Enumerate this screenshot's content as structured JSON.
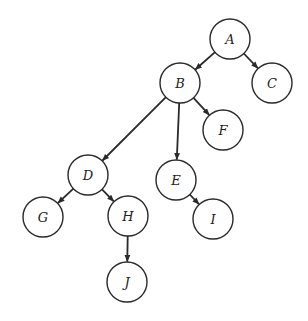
{
  "diagram": {
    "type": "tree",
    "directed": true,
    "node_radius": 20,
    "colors": {
      "background": "#ffffff",
      "stroke": "#2a2a2a",
      "label": "#222222"
    },
    "nodes": [
      {
        "id": "A",
        "label": "A",
        "x": 230,
        "y": 39
      },
      {
        "id": "B",
        "label": "B",
        "x": 180,
        "y": 83
      },
      {
        "id": "C",
        "label": "C",
        "x": 272,
        "y": 83
      },
      {
        "id": "D",
        "label": "D",
        "x": 88,
        "y": 175
      },
      {
        "id": "E",
        "label": "E",
        "x": 176,
        "y": 180
      },
      {
        "id": "F",
        "label": "F",
        "x": 223,
        "y": 130
      },
      {
        "id": "G",
        "label": "G",
        "x": 43,
        "y": 217
      },
      {
        "id": "H",
        "label": "H",
        "x": 128,
        "y": 216
      },
      {
        "id": "I",
        "label": "I",
        "x": 213,
        "y": 219
      },
      {
        "id": "J",
        "label": "J",
        "x": 127,
        "y": 282
      }
    ],
    "edges": [
      {
        "from": "A",
        "to": "B"
      },
      {
        "from": "A",
        "to": "C"
      },
      {
        "from": "B",
        "to": "D"
      },
      {
        "from": "B",
        "to": "E"
      },
      {
        "from": "B",
        "to": "F"
      },
      {
        "from": "D",
        "to": "G"
      },
      {
        "from": "D",
        "to": "H"
      },
      {
        "from": "E",
        "to": "I"
      },
      {
        "from": "H",
        "to": "J"
      }
    ]
  }
}
